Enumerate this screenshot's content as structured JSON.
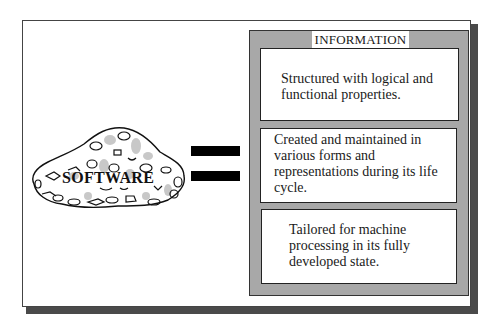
{
  "diagram": {
    "left": {
      "label": "SOFTWARE",
      "icon": "rock-blob-icon"
    },
    "operator": {
      "symbol": "=",
      "icon": "equals-icon"
    },
    "right": {
      "title": "INFORMATION",
      "items": [
        {
          "text": "Structured with logical and functional properties."
        },
        {
          "text": "Created and maintained in various forms and representations during its life cycle."
        },
        {
          "text": "Tailored for machine processing in its fully developed state."
        }
      ]
    }
  },
  "colors": {
    "panel_gray": "#a8a8a8",
    "border_dark": "#222222",
    "shadow": "#4a4a4a",
    "bar": "#000000",
    "background": "#ffffff"
  }
}
